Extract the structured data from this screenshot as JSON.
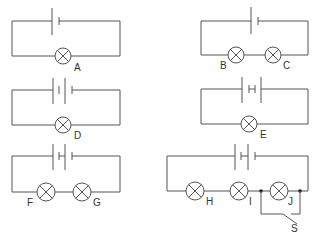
{
  "diagram": {
    "title": "",
    "colors": {
      "wire": "#555555",
      "label": "#333333",
      "background": "#ffffff"
    },
    "circuits": [
      {
        "id": "circuit-1",
        "cells": 1,
        "lamps": [
          "A"
        ],
        "arrangement": "single lamp, one cell"
      },
      {
        "id": "circuit-2",
        "cells": 1,
        "lamps": [
          "B",
          "C"
        ],
        "arrangement": "two lamps in series, one cell"
      },
      {
        "id": "circuit-3",
        "cells": 2,
        "lamps": [
          "D"
        ],
        "arrangement": "single lamp, two cells"
      },
      {
        "id": "circuit-4",
        "cells": 2,
        "lamps": [
          "E"
        ],
        "arrangement": "single lamp, two cells"
      },
      {
        "id": "circuit-5",
        "cells": 2,
        "lamps": [
          "F",
          "G"
        ],
        "arrangement": "two lamps in series, two cells"
      },
      {
        "id": "circuit-6",
        "cells": 2,
        "lamps": [
          "H",
          "I",
          "J"
        ],
        "switch": "S",
        "arrangement": "three lamps in series, switch S in parallel with lamp J"
      }
    ],
    "labels": {
      "A": "A",
      "B": "B",
      "C": "C",
      "D": "D",
      "E": "E",
      "F": "F",
      "G": "G",
      "H": "H",
      "I": "I",
      "J": "J",
      "S": "S"
    }
  }
}
